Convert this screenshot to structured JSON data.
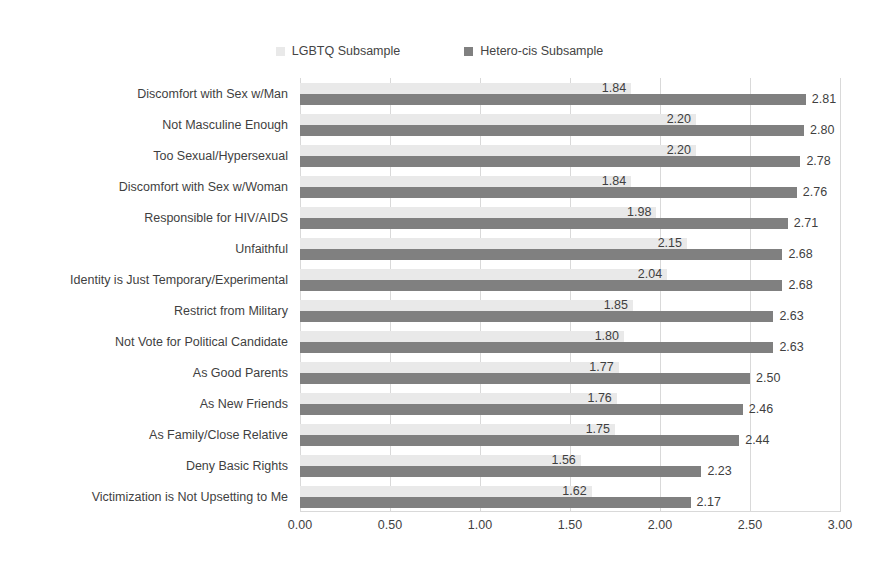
{
  "chart_data": {
    "type": "bar",
    "orientation": "horizontal",
    "title": "",
    "subtitle": "",
    "xlabel": "",
    "ylabel": "",
    "xlim": [
      0.0,
      3.0
    ],
    "xticks": [
      "0.00",
      "0.50",
      "1.00",
      "1.50",
      "2.00",
      "2.50",
      "3.00"
    ],
    "xtick_values": [
      0.0,
      0.5,
      1.0,
      1.5,
      2.0,
      2.5,
      3.0
    ],
    "grid": true,
    "grid_axis": "x",
    "legend_position": "top-center",
    "categories": [
      "Discomfort with Sex w/Man",
      "Not Masculine Enough",
      "Too Sexual/Hypersexual",
      "Discomfort with Sex w/Woman",
      "Responsible for HIV/AIDS",
      "Unfaithful",
      "Identity is Just Temporary/Experimental",
      "Restrict from Military",
      "Not Vote for Political Candidate",
      "As Good Parents",
      "As New Friends",
      "As Family/Close Relative",
      "Deny Basic Rights",
      "Victimization is Not Upsetting to Me"
    ],
    "series": [
      {
        "name": "LGBTQ Subsample",
        "color": "#e9e9e9",
        "values": [
          1.84,
          2.2,
          2.2,
          1.84,
          1.98,
          2.15,
          2.04,
          1.85,
          1.8,
          1.77,
          1.76,
          1.75,
          1.56,
          1.62
        ],
        "labels": [
          "1.84",
          "2.20",
          "2.20",
          "1.84",
          "1.98",
          "2.15",
          "2.04",
          "1.85",
          "1.80",
          "1.77",
          "1.76",
          "1.75",
          "1.56",
          "1.62"
        ]
      },
      {
        "name": "Hetero-cis Subsample",
        "color": "#808080",
        "values": [
          2.81,
          2.8,
          2.78,
          2.76,
          2.71,
          2.68,
          2.68,
          2.63,
          2.63,
          2.5,
          2.46,
          2.44,
          2.23,
          2.17
        ],
        "labels": [
          "2.81",
          "2.80",
          "2.78",
          "2.76",
          "2.71",
          "2.68",
          "2.68",
          "2.63",
          "2.63",
          "2.50",
          "2.46",
          "2.44",
          "2.23",
          "2.17"
        ]
      }
    ]
  },
  "legend": [
    {
      "label": "LGBTQ Subsample",
      "color": "#e9e9e9"
    },
    {
      "label": "Hetero-cis Subsample",
      "color": "#808080"
    }
  ]
}
